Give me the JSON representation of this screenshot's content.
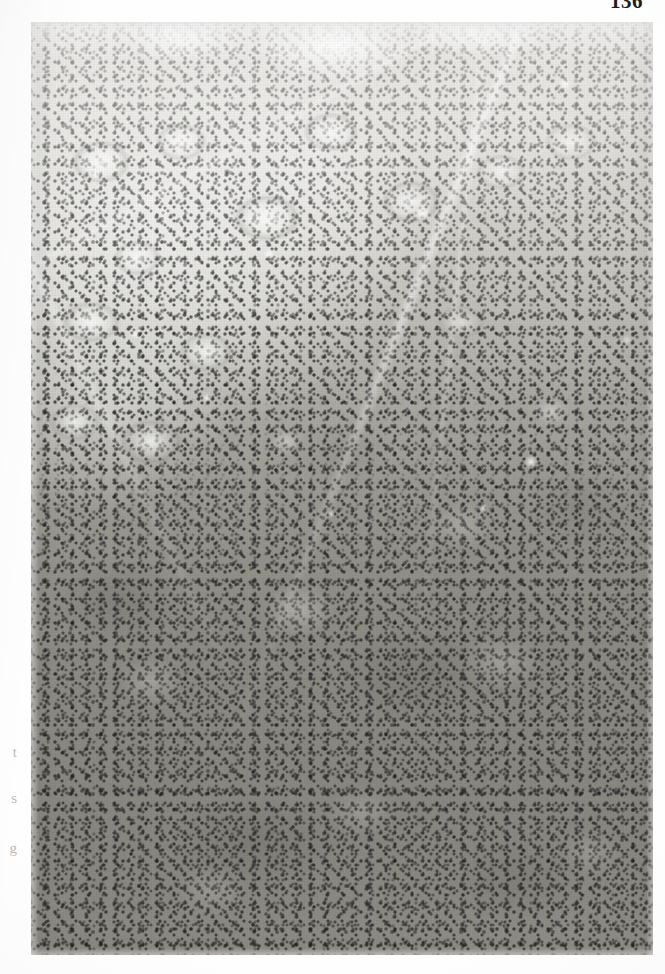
{
  "page": {
    "folio": "136",
    "background_color": "#fefefe",
    "kind": "scanned-book-page"
  },
  "gutter_fragments": [
    {
      "text": "t"
    },
    {
      "text": "s"
    },
    {
      "text": "g"
    }
  ],
  "figure": {
    "name": "histology-photomicrograph",
    "modality": "light-microscopy",
    "stain": "hematoxylin-and-eosin",
    "rendering": "black-and-white halftone print",
    "regions": [
      {
        "name": "surface-epithelium",
        "position": "top",
        "description": "irregular undulating mucosal surface with overlying lumen"
      },
      {
        "name": "glandular-zone",
        "position": "upper-left",
        "description": "pale acinar and glandular structures with vesicular nuclei and bright lumina"
      },
      {
        "name": "lymphoid-infiltrate",
        "position": "lower-two-thirds",
        "description": "dense sheet of small dark lymphocyte nuclei"
      },
      {
        "name": "pale-foci",
        "position": "within lymphoid zone",
        "description": "scattered lighter germinal-centre-like clearings"
      }
    ],
    "tones": {
      "lightest": "#ffffff",
      "pale_cytoplasm": "#e8e7e4",
      "mid_tone": "#a9a8a1",
      "dense_lymphoid": "#8a8981",
      "nuclei_dark": "#2d2d2d"
    }
  }
}
